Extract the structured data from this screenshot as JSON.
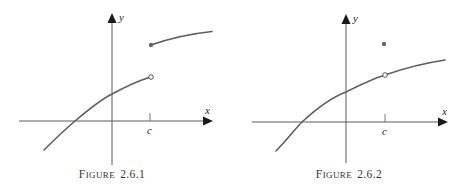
{
  "figures": [
    {
      "id": "figure-2-6-1",
      "caption_first": "F",
      "caption_rest": "IGURE",
      "caption_number": "2.6.1",
      "x_label": "x",
      "y_label": "y",
      "tick_label": "c",
      "description": "Jump discontinuity at x = c: left branch approaches an open circle, right branch starts at a filled dot higher up"
    },
    {
      "id": "figure-2-6-2",
      "caption_first": "F",
      "caption_rest": "IGURE",
      "caption_number": "2.6.2",
      "x_label": "x",
      "y_label": "y",
      "tick_label": "c",
      "description": "Removable discontinuity at x = c: continuous curve with an open circle at c, function value plotted as isolated filled dot above"
    }
  ],
  "colors": {
    "curve": "#5e5e5e",
    "axis": "#5a5a5a",
    "arrowhead": "#1a1a1a",
    "background": "#ffffff"
  }
}
